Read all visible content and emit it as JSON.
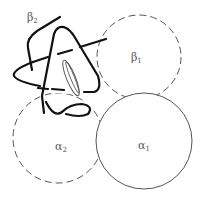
{
  "diagram": {
    "type": "hemoglobin-subunit-schematic",
    "colors": {
      "outline": "#555555",
      "chain": "#111111",
      "background": "#ffffff"
    },
    "subunits": [
      {
        "id": "alpha1",
        "symbol": "α",
        "index": "1",
        "style": "solid",
        "cx": 144,
        "cy": 141,
        "r": 48
      },
      {
        "id": "alpha2",
        "symbol": "α",
        "index": "2",
        "style": "dashed",
        "cx": 58,
        "cy": 138,
        "r": 45
      },
      {
        "id": "beta1",
        "symbol": "β",
        "index": "1",
        "style": "dashed",
        "cx": 139,
        "cy": 57,
        "r": 42
      },
      {
        "id": "beta2",
        "symbol": "β",
        "index": "2",
        "style": "polypeptide-chain"
      }
    ],
    "labels": {
      "alpha1": {
        "symbol": "α",
        "index": "1"
      },
      "alpha2": {
        "symbol": "α",
        "index": "2"
      },
      "beta1": {
        "symbol": "β",
        "index": "1"
      },
      "beta2": {
        "symbol": "β",
        "index": "2"
      }
    },
    "heme": {
      "label": "heme group"
    }
  }
}
